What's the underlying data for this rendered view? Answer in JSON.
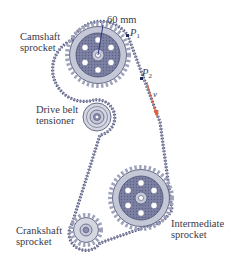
{
  "labels": {
    "camshaft": {
      "line1": "Camshaft",
      "line2": "sprocket"
    },
    "tensioner": {
      "line1": "Drive belt",
      "line2": "tensioner"
    },
    "crankshaft": {
      "line1": "Crankshaft",
      "line2": "sprocket"
    },
    "intermediate": {
      "line1": "Intermediate",
      "line2": "sprocket"
    },
    "dimension": "60 mm",
    "p1": {
      "letter": "P",
      "sub": "1"
    },
    "p2": {
      "letter": "P",
      "sub": "2"
    },
    "velocity": "v"
  },
  "colors": {
    "sprocket_fill": "#b9bccb",
    "sprocket_dark": "#4a4f72",
    "belt": "#5c6186",
    "arrow": "#e0633c",
    "text": "#3a3a48"
  }
}
